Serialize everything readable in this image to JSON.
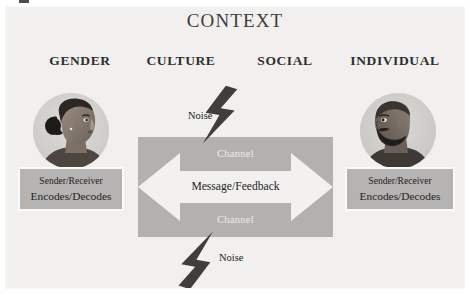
{
  "title": "CONTEXT",
  "context_labels": [
    {
      "id": "gender",
      "label": "GENDER"
    },
    {
      "id": "culture",
      "label": "CULTURE"
    },
    {
      "id": "social",
      "label": "SOCIAL"
    },
    {
      "id": "individual",
      "label": "INDIVIDUAL"
    }
  ],
  "left_party": {
    "portrait_alt": "woman-portrait",
    "role_line1": "Sender/Receiver",
    "role_line2": "Encodes/Decodes"
  },
  "right_party": {
    "portrait_alt": "man-portrait",
    "role_line1": "Sender/Receiver",
    "role_line2": "Encodes/Decodes"
  },
  "center": {
    "channel_top": "Channel",
    "channel_bottom": "Channel",
    "message": "Message/Feedback"
  },
  "noise": {
    "top_label": "Noise",
    "bottom_label": "Noise"
  },
  "colors": {
    "page_background": "#f1f0ee",
    "band_gray": "#b3b1af",
    "box_gray": "#b6b4b2",
    "arrow_fill": "#f2f1ef",
    "bolt_dark": "#3f3e3d",
    "title_text": "#3c3c3c",
    "label_text": "#2e2e2e",
    "channel_text": "#edecea"
  }
}
